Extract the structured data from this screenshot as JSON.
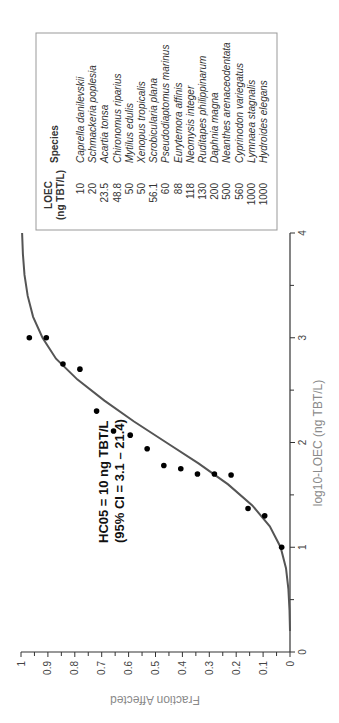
{
  "chart_data": {
    "type": "scatter",
    "title": "",
    "xlabel": "log10-LOEC (ng TBT/L)",
    "ylabel": "Fraction Affected",
    "xlim": [
      0,
      4
    ],
    "ylim": [
      0,
      1
    ],
    "x_ticks": [
      "0",
      "1",
      "2",
      "3",
      "4"
    ],
    "y_ticks": [
      "0",
      "0.1",
      "0.2",
      "0.3",
      "0.4",
      "0.5",
      "0.6",
      "0.7",
      "0.8",
      "0.9",
      "1"
    ],
    "grid": false,
    "orientation_note": "figure rotated 90 degrees counter-clockwise",
    "annotation": {
      "line1": "HC05 = 10 ng TBT/L",
      "line2": "(95% CI = 3.1 – 21.4)"
    },
    "series": [
      {
        "name": "Species LOEC",
        "kind": "points",
        "x": [
          1.0,
          1.3,
          1.37,
          1.69,
          1.7,
          1.7,
          1.75,
          1.78,
          1.94,
          2.07,
          2.11,
          2.3,
          2.7,
          2.75,
          3.0,
          3.0
        ],
        "y": [
          0.031,
          0.094,
          0.156,
          0.219,
          0.281,
          0.344,
          0.406,
          0.469,
          0.531,
          0.594,
          0.656,
          0.719,
          0.781,
          0.844,
          0.906,
          0.969
        ]
      },
      {
        "name": "Fitted SSD curve",
        "kind": "line",
        "x": [
          0.2,
          0.4,
          0.6,
          0.8,
          1.0,
          1.2,
          1.4,
          1.6,
          1.8,
          2.0,
          2.2,
          2.4,
          2.6,
          2.8,
          3.0,
          3.2,
          3.4,
          3.6,
          3.8,
          4.0
        ],
        "y": [
          0.0,
          0.002,
          0.006,
          0.015,
          0.035,
          0.075,
          0.14,
          0.23,
          0.34,
          0.46,
          0.58,
          0.69,
          0.79,
          0.87,
          0.92,
          0.955,
          0.975,
          0.987,
          0.993,
          0.996
        ]
      }
    ],
    "table": {
      "headers": [
        "LOEC\n(ng TBT/L)",
        "Species"
      ],
      "header_loec_line1": "LOEC",
      "header_loec_line2": "(ng TBT/L)",
      "header_species": "Species",
      "rows": [
        {
          "loec": "10",
          "species": "Caprella danilevskii"
        },
        {
          "loec": "20",
          "species": "Schmackeria poplesia"
        },
        {
          "loec": "23.5",
          "species": "Acartia tonsa"
        },
        {
          "loec": "48.8",
          "species": "Chironomus riparius"
        },
        {
          "loec": "50",
          "species": "Mytilus edulis"
        },
        {
          "loec": "50",
          "species": "Xenopus tropicalis"
        },
        {
          "loec": "56.1",
          "species": "Scrobicularia plana"
        },
        {
          "loec": "60",
          "species": "Pseudodiaptomus marinus"
        },
        {
          "loec": "88",
          "species": "Eurytemora affinis"
        },
        {
          "loec": "118",
          "species": "Neomysis integer"
        },
        {
          "loec": "130",
          "species": "Ruditapes philippinarum"
        },
        {
          "loec": "200",
          "species": "Daphnia magna"
        },
        {
          "loec": "500",
          "species": "Neanthes arenaceodentata"
        },
        {
          "loec": "560",
          "species": "Cyprinodon variegatus"
        },
        {
          "loec": "1000",
          "species": "Lymnaea stagnalis"
        },
        {
          "loec": "1000",
          "species": "Hydroides elegans"
        }
      ]
    },
    "colors": {
      "points": "#000000",
      "curve": "#555555",
      "axis": "#333333",
      "axis_title": "#8a8a8a",
      "table_border": "#999999"
    }
  }
}
